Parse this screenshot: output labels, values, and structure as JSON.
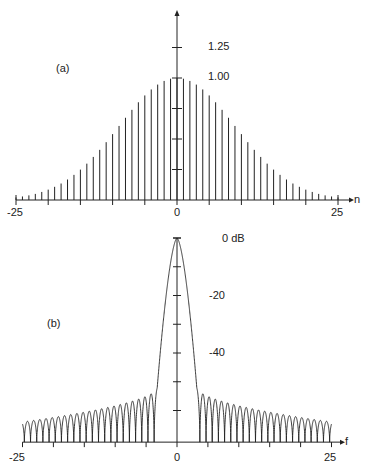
{
  "chart_data": [
    {
      "type": "stem",
      "panel_label": "(a)",
      "xlabel": "n",
      "ylabel": "",
      "x_tick_labels": [
        "-25",
        "0",
        "25"
      ],
      "x_ticks": [
        -25,
        -20,
        -15,
        -10,
        -5,
        0,
        5,
        10,
        15,
        20,
        25
      ],
      "y_tick_labels": [
        "1.25",
        "1.00"
      ],
      "y_ticks": [
        0.25,
        0.5,
        0.75,
        1.0,
        1.25
      ],
      "xlim": [
        -25,
        25
      ],
      "ylim": [
        0,
        1.35
      ],
      "grid": false,
      "x": [
        -25,
        -24,
        -23,
        -22,
        -21,
        -20,
        -19,
        -18,
        -17,
        -16,
        -15,
        -14,
        -13,
        -12,
        -11,
        -10,
        -9,
        -8,
        -7,
        -6,
        -5,
        -4,
        -3,
        -2,
        -1,
        0,
        1,
        2,
        3,
        4,
        5,
        6,
        7,
        8,
        9,
        10,
        11,
        12,
        13,
        14,
        15,
        16,
        17,
        18,
        19,
        20,
        21,
        22,
        23,
        24,
        25
      ],
      "values": [
        0.021,
        0.029,
        0.038,
        0.05,
        0.066,
        0.085,
        0.108,
        0.135,
        0.168,
        0.206,
        0.249,
        0.298,
        0.353,
        0.411,
        0.474,
        0.54,
        0.607,
        0.674,
        0.739,
        0.801,
        0.857,
        0.906,
        0.946,
        0.976,
        0.994,
        1.0,
        0.994,
        0.976,
        0.946,
        0.906,
        0.857,
        0.801,
        0.739,
        0.674,
        0.607,
        0.54,
        0.474,
        0.411,
        0.353,
        0.298,
        0.249,
        0.206,
        0.168,
        0.135,
        0.108,
        0.085,
        0.066,
        0.05,
        0.038,
        0.029,
        0.021
      ]
    },
    {
      "type": "line",
      "panel_label": "(b)",
      "xlabel": "f",
      "ylabel": "",
      "x_tick_labels": [
        "-25",
        "0",
        "25"
      ],
      "x_ticks": [
        -25,
        -20,
        -15,
        -10,
        -5,
        0,
        5,
        10,
        15,
        20,
        25
      ],
      "y_tick_labels": [
        "0 dB",
        "-20",
        "-40"
      ],
      "y_ticks": [
        0,
        -10,
        -20,
        -30,
        -40,
        -50,
        -60
      ],
      "xlim": [
        -25,
        25
      ],
      "ylim": [
        -71,
        0
      ],
      "grid": false,
      "main_lobe": {
        "peak_db": 0,
        "peak_f": 0,
        "half_width_f": 3.2,
        "edge_db": -52
      },
      "sidelobes": {
        "count_per_side": 22,
        "spacing_f": 1.0,
        "peak_db_near": -52,
        "peak_db_far": -64,
        "null_db": -71
      }
    }
  ],
  "labels": {
    "a_panel": "(a)",
    "a_xname": "n",
    "a_xmin": "-25",
    "a_xzero": "0",
    "a_xmax": "25",
    "a_y125": "1.25",
    "a_y100": "1.00",
    "b_panel": "(b)",
    "b_xname": "f",
    "b_xmin": "-25",
    "b_xzero": "0",
    "b_xmax": "25",
    "b_y0": "0 dB",
    "b_y20": "-20",
    "b_y40": "-40"
  },
  "style": {
    "ink": "#222222",
    "background": "#ffffff"
  }
}
